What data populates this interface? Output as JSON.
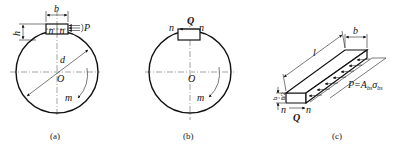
{
  "figures": [
    {
      "id": "a",
      "caption": "(a)",
      "labels": {
        "width": "b",
        "height": "h",
        "force": "P",
        "shear_plane_left": "n",
        "shear_plane_right": "n",
        "diameter": "d",
        "center": "O",
        "moment": "m"
      }
    },
    {
      "id": "b",
      "caption": "(b)",
      "labels": {
        "shear_force": "Q",
        "shear_plane_left": "n",
        "shear_plane_right": "n",
        "center": "O",
        "moment": "m"
      }
    },
    {
      "id": "c",
      "caption": "(c)",
      "labels": {
        "length": "l",
        "width": "b",
        "height": "h",
        "half_height": "h/2",
        "shear_plane_left": "n",
        "shear_plane_right": "n",
        "shear_force": "Q",
        "bearing_force": "P=A",
        "bearing_sub_area": "bs",
        "bearing_sigma": "σ",
        "bearing_sub_sigma": "bs"
      }
    }
  ]
}
